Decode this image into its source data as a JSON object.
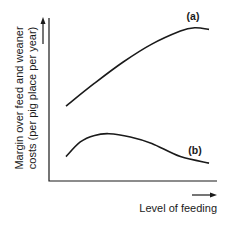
{
  "chart_data": {
    "type": "line",
    "title": "",
    "xlabel": "Level of feeding",
    "ylabel_lines": [
      "Margin over feed and weaner",
      "costs (per pig place per year)"
    ],
    "xlim": [
      0,
      1
    ],
    "ylim": [
      0,
      1
    ],
    "grid": false,
    "legend": "inline labels at curve ends",
    "axis_arrows": true,
    "tick_labels": [],
    "series": [
      {
        "name": "(a)",
        "x": [
          0.0,
          0.2,
          0.4,
          0.6,
          0.8,
          0.9,
          1.0
        ],
        "y": [
          0.46,
          0.6,
          0.73,
          0.84,
          0.92,
          0.94,
          0.93
        ]
      },
      {
        "name": "(b)",
        "x": [
          0.0,
          0.1,
          0.2,
          0.3,
          0.45,
          0.6,
          0.8,
          1.0
        ],
        "y": [
          0.15,
          0.24,
          0.28,
          0.29,
          0.27,
          0.23,
          0.15,
          0.11
        ]
      }
    ]
  }
}
